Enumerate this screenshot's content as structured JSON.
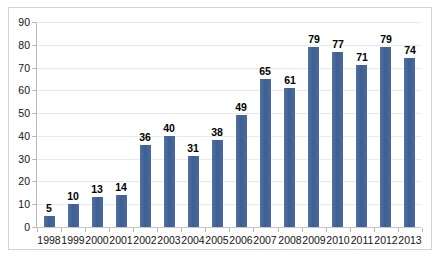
{
  "chart_data": {
    "type": "bar",
    "title": "",
    "subtitle": "",
    "xlabel": "",
    "ylabel": "",
    "categories": [
      "1998",
      "1999",
      "2000",
      "2001",
      "2002",
      "2003",
      "2004",
      "2005",
      "2006",
      "2007",
      "2008",
      "2009",
      "2010",
      "2011",
      "2012",
      "2013"
    ],
    "values": [
      5,
      10,
      13,
      14,
      36,
      40,
      31,
      38,
      49,
      65,
      61,
      79,
      77,
      71,
      79,
      74
    ],
    "data_labels": [
      "5",
      "10",
      "13",
      "14",
      "36",
      "40",
      "31",
      "38",
      "49",
      "65",
      "61",
      "79",
      "77",
      "71",
      "79",
      "74"
    ],
    "ylim": [
      0,
      90
    ],
    "ytick_step": 10,
    "ytick_labels": [
      "90",
      "80",
      "70",
      "60",
      "50",
      "40",
      "30",
      "20",
      "10",
      "0"
    ],
    "ytick_values": [
      90,
      80,
      70,
      60,
      50,
      40,
      30,
      20,
      10,
      0
    ],
    "grid": true,
    "grid_axis": "y",
    "legend": false,
    "legend_position": "none",
    "series": [
      {
        "name": "",
        "values": [
          5,
          10,
          13,
          14,
          36,
          40,
          31,
          38,
          49,
          65,
          61,
          79,
          77,
          71,
          79,
          74
        ]
      }
    ]
  },
  "style": {
    "bar_color": "#4a6a9e",
    "grid_color": "#e9e9e9",
    "axis_color": "#b9b9b9",
    "frame_color": "#d2d2d2",
    "label_color": "#141414",
    "data_label_color": "#000000",
    "plot_background": "#ffffff",
    "page_background": "#ffffff"
  }
}
